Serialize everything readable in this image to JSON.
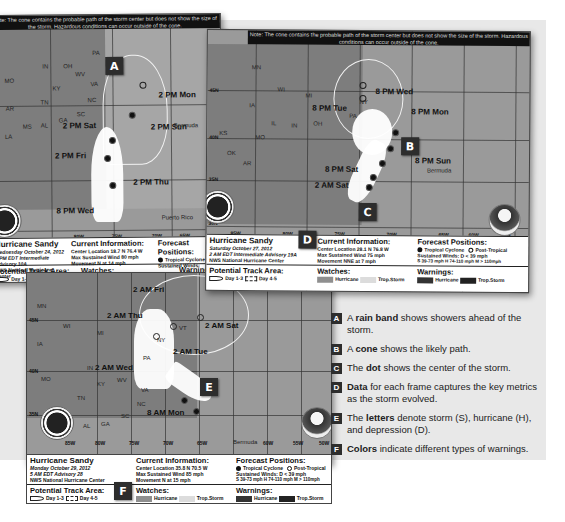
{
  "maps": [
    {
      "id": "map-oct24",
      "note": "Note: The cone contains the probable path of the storm center but does not show the size of the storm. Hazardous conditions can occur outside of the cone.",
      "time_labels": [
        "2 PM Mon",
        "2 PM Sun",
        "2 PM Sat",
        "2 PM Fri",
        "2 PM Thu",
        "8 PM Wed"
      ],
      "state_labels": [
        "PA",
        "WV",
        "VA",
        "NC",
        "SC",
        "GA",
        "AL",
        "MS",
        "TN",
        "KY",
        "OH",
        "IN",
        "MO",
        "AR",
        "LA"
      ],
      "place_labels": [
        "Bermuda",
        "Puerto Rico"
      ],
      "lon_labels": [
        "85W",
        "80W",
        "75W",
        "70W",
        "65W"
      ],
      "badge": "A",
      "info": {
        "storm_name": "Hurricane Sandy",
        "date": "Wednesday October 24, 2012",
        "advisory": "5 PM EDT Intermediate Advisory 10A",
        "center": "NWS National Hurricane Center",
        "current_title": "Current Information:",
        "center_location": "Center Location 18.7 N 76.4 W",
        "max_wind": "Max Sustained Wind 80 mph",
        "movement": "Movement N at 14 mph",
        "forecast_title": "Forecast Positions:",
        "forecast_tropical": "Tropical Cyclone",
        "forecast_sustained": "Sustained Winds:",
        "forecast_scale": "S 39-73 mph",
        "track_title": "Potential Track Area:",
        "track_day13": "Day 1-3",
        "track_day45": "Day 4-5",
        "watches_title": "Watches:",
        "watch_hurricane": "Hurricane",
        "watch_ts": "Trop.Storm",
        "warnings_title": "Warnings:"
      }
    },
    {
      "id": "map-oct27",
      "note": "Note: The cone contains the probable path of the storm center but does not show the size of the storm. Hazardous conditions can occur outside of the cone.",
      "time_labels": [
        "8 PM Wed",
        "8 PM Tue",
        "8 PM Mon",
        "8 PM Sun",
        "8 PM Sat",
        "2 AM Sat"
      ],
      "state_labels": [
        "MN",
        "WI",
        "MI",
        "IA",
        "IL",
        "IN",
        "OH",
        "PA",
        "NY",
        "MO",
        "KS",
        "OK",
        "AR",
        "MS",
        "LA",
        "TN",
        "AL",
        "GA",
        "SC",
        "NC",
        "VA"
      ],
      "place_labels": [
        "Bermuda"
      ],
      "lat_labels": [
        "45N",
        "40N",
        "35N",
        "30N"
      ],
      "lon_labels": [
        "85W",
        "80W",
        "75W",
        "70W",
        "65W",
        "60W",
        "55W"
      ],
      "badges": [
        "B",
        "C",
        "D"
      ],
      "info": {
        "storm_name": "Hurricane Sandy",
        "date": "Saturday October 27, 2012",
        "advisory": "2 AM EDT Intermediate Advisory 19A",
        "center": "NWS National Hurricane Center",
        "current_title": "Current Information:",
        "center_location": "Center Location 28.1 N 76.8 W",
        "max_wind": "Max Sustained Wind 75 mph",
        "movement": "Movement NNE at 7 mph",
        "forecast_title": "Forecast Positions:",
        "forecast_tropical": "Tropical Cyclone",
        "forecast_post": "Post-Tropical",
        "forecast_sustained": "Sustained Winds:",
        "forecast_d": "D < 39 mph",
        "forecast_scale": "S 39-73 mph  H 74-110 mph  M > 110mph",
        "track_title": "Potential Track Area:",
        "track_day13": "Day 1-3",
        "track_day45": "Day 4-5",
        "watches_title": "Watches:",
        "watch_hurricane": "Hurricane",
        "watch_ts": "Trop.Storm",
        "warnings_title": "Warnings:",
        "warn_hurricane": "Hurricane",
        "warn_ts": "Trop.Storm"
      }
    },
    {
      "id": "map-oct29",
      "time_labels": [
        "2 AM Fri",
        "2 AM Thu",
        "2 AM Sat",
        "2 AM Tue",
        "2 AM Wed",
        "8 AM Mon"
      ],
      "state_labels": [
        "MN",
        "WI",
        "MI",
        "IA",
        "IL",
        "IN",
        "NY",
        "PA",
        "VT",
        "MO",
        "KY",
        "WV",
        "VA",
        "TN",
        "NC",
        "SC",
        "GA",
        "AL"
      ],
      "place_labels": [
        "Bermuda"
      ],
      "lat_labels": [
        "45N",
        "40N",
        "35N"
      ],
      "lon_labels": [
        "85W",
        "80W",
        "75W",
        "70W",
        "65W",
        "60W",
        "55W",
        "50W"
      ],
      "badges": [
        "E",
        "F"
      ],
      "info": {
        "storm_name": "Hurricane Sandy",
        "date": "Monday October 29, 2012",
        "advisory": "5 AM EDT Advisory 28",
        "center": "NWS National Hurricane Center",
        "current_title": "Current Information:",
        "center_location": "Center Location 35.8 N 70.5 W",
        "max_wind": "Max Sustained Wind 85 mph",
        "movement": "Movement N at 15 mph",
        "forecast_title": "Forecast Positions:",
        "forecast_tropical": "Tropical Cyclone",
        "forecast_post": "Post-Tropical",
        "forecast_sustained": "Sustained Winds:",
        "forecast_d": "D < 39 mph",
        "forecast_scale": "S 39-73 mph  H 74-110 mph  M > 110mph",
        "track_title": "Potential Track Area:",
        "track_day13": "Day 1-3",
        "track_day45": "Day 4-5",
        "watches_title": "Watches:",
        "watch_hurricane": "Hurricane",
        "watch_ts": "Trop.Storm",
        "warnings_title": "Warnings:",
        "warn_hurricane": "Hurricane",
        "warn_ts": "Trop.Storm"
      }
    }
  ],
  "legend": [
    {
      "letter": "A",
      "pre": "A ",
      "bold": "rain band",
      "post": " shows showers ahead of the storm."
    },
    {
      "letter": "B",
      "pre": "A ",
      "bold": "cone",
      "post": " shows the likely path."
    },
    {
      "letter": "C",
      "pre": "The ",
      "bold": "dot",
      "post": " shows the center of the storm."
    },
    {
      "letter": "D",
      "pre": "",
      "bold": "Data",
      "post": " for each frame captures the key metrics as the storm evolved."
    },
    {
      "letter": "E",
      "pre": "The ",
      "bold": "letters",
      "post": " denote storm (S), hurricane (H), and depression (D)."
    },
    {
      "letter": "F",
      "pre": "",
      "bold": "Colors",
      "post": " indicate different types of warnings."
    }
  ]
}
